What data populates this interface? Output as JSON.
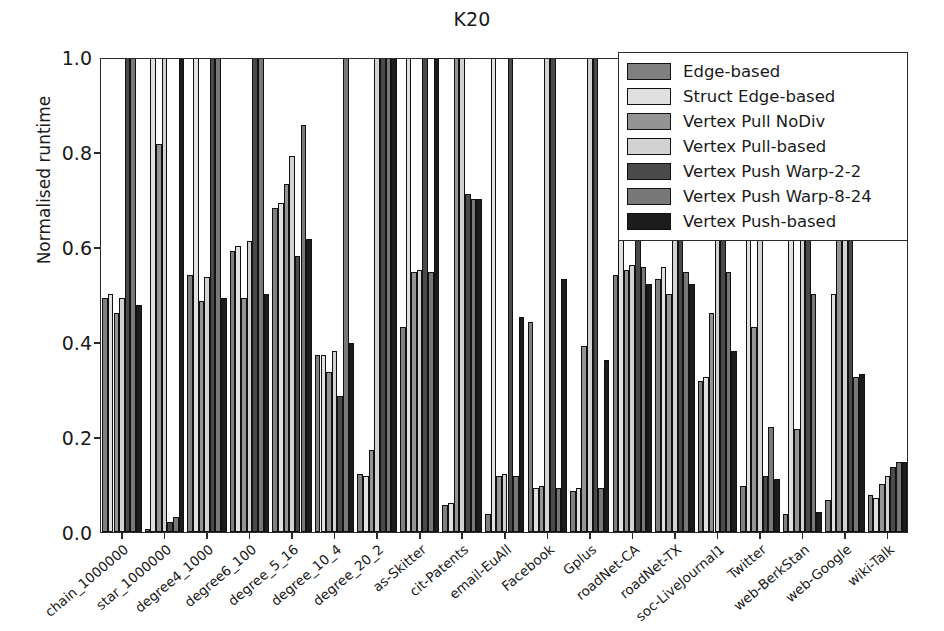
{
  "chart_data": {
    "type": "bar",
    "title": "K20",
    "xlabel": "",
    "ylabel": "Normalised runtime",
    "ylim": [
      0.0,
      1.0
    ],
    "yticks": [
      0.0,
      0.2,
      0.4,
      0.6,
      0.8,
      1.0
    ],
    "ytick_labels": [
      "0.0",
      "0.2",
      "0.4",
      "0.6",
      "0.8",
      "1.0"
    ],
    "grid": false,
    "legend_position": "upper right",
    "categories": [
      "chain_1000000",
      "star_1000000",
      "degree4_1000",
      "degree6_100",
      "degree_5_16",
      "degree_10_4",
      "degree_20_2",
      "as-Skitter",
      "cit-Patents",
      "email-EuAll",
      "Facebook",
      "Gplus",
      "roadNet-CA",
      "roadNet-TX",
      "soc-LiveJournal1",
      "Twitter",
      "web-BerkStan",
      "web-Google",
      "wiki-Talk"
    ],
    "series": [
      {
        "name": "Edge-based",
        "color": "#808080",
        "values": [
          0.49,
          0.005,
          0.54,
          0.59,
          0.68,
          0.37,
          0.12,
          0.43,
          0.055,
          0.035,
          0.44,
          0.085,
          0.54,
          0.53,
          0.315,
          0.095,
          0.035,
          0.065,
          0.075
        ]
      },
      {
        "name": "Struct Edge-based",
        "color": "#e0e0e0",
        "values": [
          0.5,
          1.0,
          1.0,
          0.6,
          0.69,
          0.37,
          0.115,
          1.0,
          0.06,
          1.0,
          0.09,
          0.09,
          1.0,
          0.555,
          0.325,
          1.0,
          1.0,
          0.5,
          0.07
        ]
      },
      {
        "name": "Vertex Pull NoDiv",
        "color": "#949494",
        "values": [
          0.46,
          0.815,
          0.485,
          0.49,
          0.73,
          0.335,
          0.17,
          0.545,
          1.0,
          0.115,
          0.095,
          0.39,
          0.55,
          0.5,
          0.46,
          0.43,
          0.215,
          1.0,
          0.1
        ]
      },
      {
        "name": "Vertex Pull-based",
        "color": "#d2d2d2",
        "values": [
          0.49,
          1.0,
          0.535,
          0.61,
          0.79,
          0.38,
          1.0,
          0.55,
          1.0,
          0.12,
          1.0,
          1.0,
          0.56,
          1.0,
          1.0,
          1.0,
          1.0,
          1.0,
          0.115
        ]
      },
      {
        "name": "Vertex Push Warp-2-2",
        "color": "#4a4a4a",
        "values": [
          1.0,
          0.02,
          1.0,
          1.0,
          0.58,
          0.285,
          1.0,
          1.0,
          0.71,
          1.0,
          1.0,
          1.0,
          1.0,
          1.0,
          1.0,
          0.115,
          1.0,
          1.0,
          0.135
        ]
      },
      {
        "name": "Vertex Push Warp-8-24",
        "color": "#787878",
        "values": [
          1.0,
          0.03,
          1.0,
          1.0,
          0.855,
          1.0,
          1.0,
          0.545,
          0.7,
          0.115,
          0.09,
          0.09,
          0.555,
          0.545,
          0.545,
          0.22,
          0.5,
          0.325,
          0.145
        ]
      },
      {
        "name": "Vertex Push-based",
        "color": "#1c1c1c",
        "values": [
          0.475,
          1.0,
          0.49,
          0.5,
          0.615,
          0.395,
          1.0,
          1.0,
          0.7,
          0.45,
          0.53,
          0.36,
          0.52,
          0.52,
          0.38,
          0.11,
          0.04,
          0.33,
          0.145
        ]
      }
    ]
  }
}
